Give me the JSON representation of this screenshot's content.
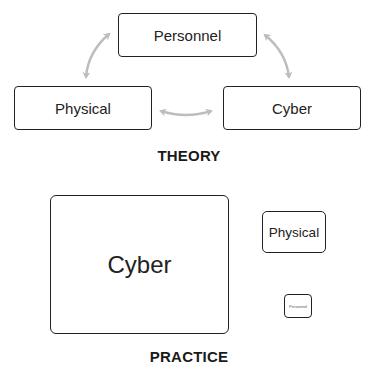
{
  "theory": {
    "caption": "THEORY",
    "nodes": {
      "personnel": "Personnel",
      "physical": "Physical",
      "cyber": "Cyber"
    },
    "arrows": [
      {
        "from": "personnel",
        "to": "physical",
        "type": "bidirectional"
      },
      {
        "from": "personnel",
        "to": "cyber",
        "type": "bidirectional"
      },
      {
        "from": "physical",
        "to": "cyber",
        "type": "bidirectional"
      }
    ],
    "arrow_color": "#bdbdbd"
  },
  "practice": {
    "caption": "PRACTICE",
    "nodes": {
      "cyber": "Cyber",
      "physical": "Physical",
      "personnel": "Personnel"
    }
  }
}
